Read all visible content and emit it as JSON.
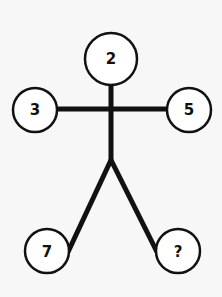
{
  "diagram": {
    "nodes": {
      "head": "2",
      "left_hand": "3",
      "right_hand": "5",
      "left_foot": "7",
      "right_foot": "?"
    },
    "colors": {
      "line": "#111111",
      "background": "#f7f7f7",
      "circle_fill": "#ffffff"
    }
  }
}
